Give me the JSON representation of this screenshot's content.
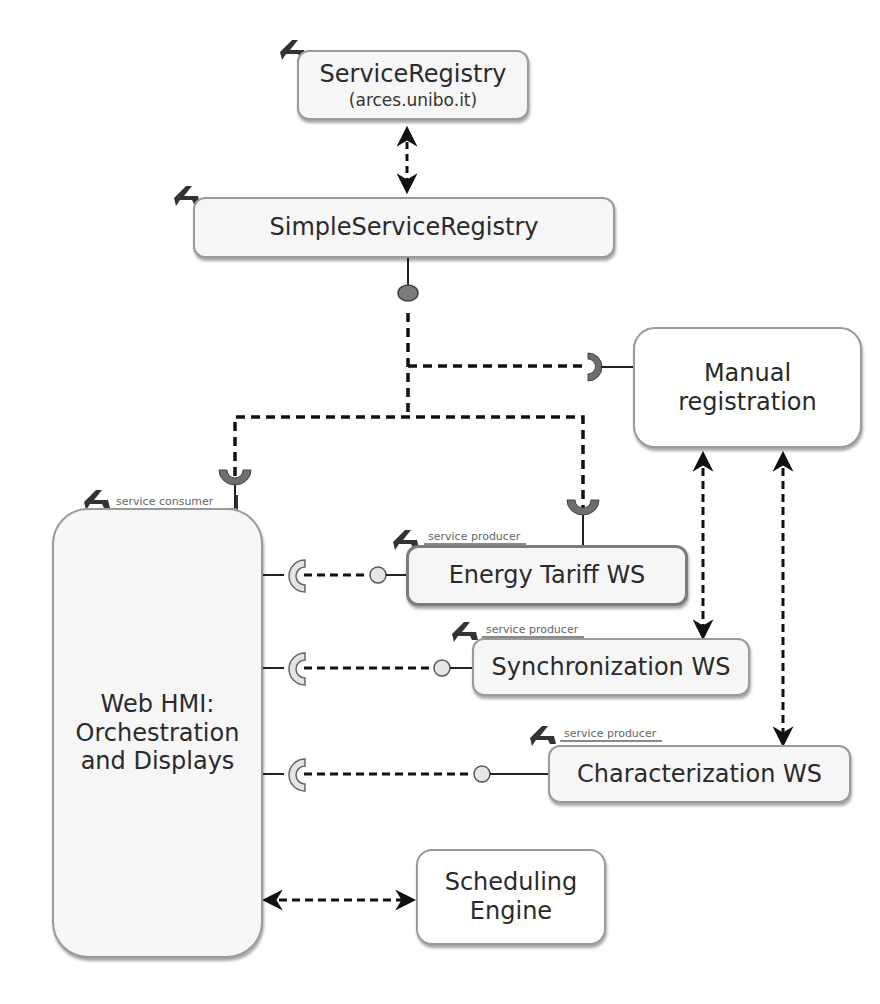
{
  "diagram": {
    "corner_fragment": "",
    "components": {
      "service_registry": {
        "title": "ServiceRegistry",
        "subtitle": "(arces.unibo.it)"
      },
      "simple_service_registry": {
        "title": "SimpleServiceRegistry"
      },
      "manual_registration": {
        "title_line1": "Manual",
        "title_line2": "registration"
      },
      "web_hmi": {
        "role": "service consumer",
        "title_line1": "Web HMI:",
        "title_line2": "Orchestration",
        "title_line3": "and Displays"
      },
      "energy_tariff_ws": {
        "role": "service producer",
        "title": "Energy Tariff WS"
      },
      "synchronization_ws": {
        "role": "service producer",
        "title": "Synchronization WS"
      },
      "characterization_ws": {
        "role": "service producer",
        "title": "Characterization WS"
      },
      "scheduling_engine": {
        "title_line1": "Scheduling",
        "title_line2": "Engine"
      }
    },
    "connections": [
      {
        "from": "ServiceRegistry",
        "to": "SimpleServiceRegistry",
        "style": "dashed",
        "arrows": "both"
      },
      {
        "from": "SimpleServiceRegistry",
        "to": "Manual registration",
        "style": "dashed",
        "type": "provided-required interface"
      },
      {
        "from": "SimpleServiceRegistry",
        "to": "Web HMI: Orchestration and Displays",
        "style": "dashed",
        "type": "provided-required interface"
      },
      {
        "from": "SimpleServiceRegistry",
        "to": "Energy Tariff WS",
        "style": "dashed",
        "type": "provided-required interface"
      },
      {
        "from": "Energy Tariff WS",
        "to": "Web HMI: Orchestration and Displays",
        "style": "dashed",
        "type": "provided-required interface"
      },
      {
        "from": "Synchronization WS",
        "to": "Web HMI: Orchestration and Displays",
        "style": "dashed",
        "type": "provided-required interface"
      },
      {
        "from": "Characterization WS",
        "to": "Web HMI: Orchestration and Displays",
        "style": "dashed",
        "type": "provided-required interface"
      },
      {
        "from": "Manual registration",
        "to": "Synchronization WS",
        "style": "dashed",
        "arrows": "both"
      },
      {
        "from": "Manual registration",
        "to": "Characterization WS",
        "style": "dashed",
        "arrows": "both"
      },
      {
        "from": "Web HMI: Orchestration and Displays",
        "to": "Scheduling Engine",
        "style": "dashed",
        "arrows": "both"
      }
    ],
    "colors": {
      "box_border": "#9a9a9a",
      "box_fill": "#f6f6f6",
      "socket_dark": "#6e6e6e",
      "socket_light": "#e4e4e4",
      "provided_ball_dark": "#7a7a7a",
      "provided_ball_light": "#e6e6e6",
      "connector": "#111111"
    }
  }
}
